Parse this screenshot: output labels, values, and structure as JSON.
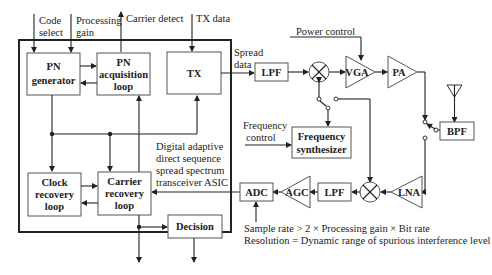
{
  "diagram": {
    "asic_label": [
      "Digital adaptive",
      "direct sequence",
      "spread spectrum",
      "transceiver ASIC"
    ],
    "inputs": {
      "code_select": [
        "Code",
        "select"
      ],
      "processing_gain": [
        "Processing",
        "gain"
      ],
      "carrier_detect": "Carrier detect",
      "tx_data": "TX data"
    },
    "blocks": {
      "pn_generator": [
        "PN",
        "generator"
      ],
      "pn_acquisition": [
        "PN",
        "acquisition",
        "loop"
      ],
      "tx": "TX",
      "clock_recovery": [
        "Clock",
        "recovery",
        "loop"
      ],
      "carrier_recovery": [
        "Carrier",
        "recovery",
        "loop"
      ],
      "decision": "Decision",
      "lpf_tx": "LPF",
      "vga": "VGA",
      "pa": "PA",
      "bpf": "BPF",
      "freq_synth": [
        "Frequency",
        "synthesizer"
      ],
      "adc": "ADC",
      "agc": "AGC",
      "lpf_rx": "LPF",
      "lna": "LNA"
    },
    "labels": {
      "spread_data": [
        "Spread",
        "data"
      ],
      "power_control": "Power control",
      "frequency_control": [
        "Frequency",
        "control"
      ],
      "sample_rate": "Sample rate  > 2 × Processing gain ×  Bit rate",
      "resolution": "Resolution = Dynamic range of spurious interference level"
    }
  }
}
